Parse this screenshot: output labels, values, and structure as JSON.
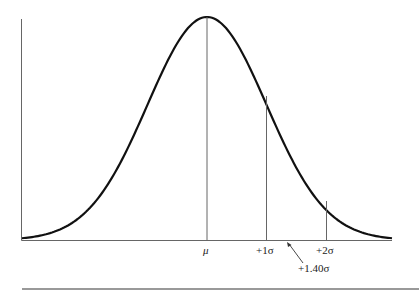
{
  "chart_data": {
    "type": "line",
    "title": "",
    "xlabel": "",
    "ylabel": "",
    "grid": false,
    "legend": null,
    "x": [
      -3.0,
      -2.5,
      -2.0,
      -1.5,
      -1.0,
      -0.5,
      0.0,
      0.5,
      1.0,
      1.5,
      2.0,
      2.5,
      3.0
    ],
    "series": [
      {
        "name": "normal density",
        "values": [
          0.004,
          0.018,
          0.054,
          0.13,
          0.242,
          0.352,
          0.399,
          0.352,
          0.242,
          0.13,
          0.054,
          0.018,
          0.004
        ]
      }
    ],
    "markers": [
      {
        "label": "μ",
        "z": 0
      },
      {
        "label": "+1σ",
        "z": 1
      },
      {
        "label": "+2σ",
        "z": 2
      }
    ],
    "annotations": [
      {
        "label": "+1.40σ",
        "z": 1.4,
        "type": "arrow"
      }
    ],
    "xlim": [
      -3.0,
      3.0
    ]
  },
  "labels": {
    "mu": "μ",
    "plus1": "+1σ",
    "plus2": "+2σ",
    "plus140": "+1.40σ"
  }
}
